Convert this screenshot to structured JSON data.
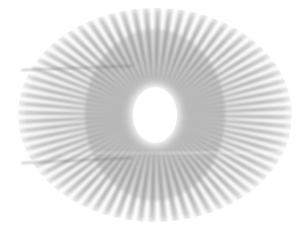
{
  "image": {
    "kind": "siemens-star-resolution-test-pattern",
    "title": "Siemens star radial spoke test pattern",
    "width_px": 308,
    "height_px": 235,
    "background_color": "#ffffff"
  },
  "pattern": {
    "name": "radial-spoke-star",
    "spoke_count": 72,
    "spoke_pair_period_deg": 5,
    "spoke_duty_cycle": 0.5,
    "start_angle_deg": 0,
    "center_x": 155,
    "center_y": 115,
    "outer_radius_x": 137,
    "outer_radius_y": 107,
    "inner_radius_x": 27,
    "inner_radius_y": 33,
    "spoke_color_inner": "#8f8f8f",
    "spoke_color_mid": "#a0a0a0",
    "spoke_color_outer": "#bcbcbc",
    "blur_px": 1.6,
    "edge_fade": true
  },
  "hub": {
    "name": "central-blank-ellipse",
    "center_x": 155,
    "center_y": 115,
    "radius_x": 27,
    "radius_y": 33,
    "fill": "#ffffff",
    "halo_blur_px": 5
  },
  "artifacts": {
    "label": "faint horizontal scan-line artifacts",
    "lines": [
      {
        "name": "upper-left-dark-streak",
        "x1": 22,
        "y1": 70,
        "x2": 132,
        "y2": 66,
        "color": "#6e6e6e",
        "opacity": 0.5,
        "thickness": 1.6
      },
      {
        "name": "lower-left-dark-streak",
        "x1": 22,
        "y1": 163,
        "x2": 132,
        "y2": 158,
        "color": "#6e6e6e",
        "opacity": 0.5,
        "thickness": 1.6
      },
      {
        "name": "right-light-scanline",
        "x1": 160,
        "y1": 153,
        "x2": 292,
        "y2": 152,
        "color": "#ffffff",
        "opacity": 0.75,
        "thickness": 1.2
      },
      {
        "name": "center-light-scanline",
        "x1": 60,
        "y1": 153,
        "x2": 160,
        "y2": 153,
        "color": "#ffffff",
        "opacity": 0.45,
        "thickness": 1.0
      }
    ]
  },
  "palette": {
    "background": "#ffffff",
    "spoke_gray": "#999999",
    "hub_white": "#ffffff",
    "artifact_gray": "#6e6e6e"
  }
}
